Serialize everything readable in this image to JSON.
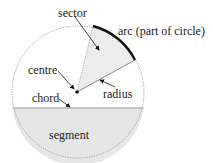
{
  "labels": {
    "sector": "sector",
    "arc": "arc (part of circle)",
    "centre": "centre",
    "radius": "radius",
    "chord": "chord",
    "segment": "segment"
  },
  "colors": {
    "fill_shaded": "#e6e6e6",
    "outline": "#888888",
    "arc": "#111111",
    "text": "#222222"
  }
}
